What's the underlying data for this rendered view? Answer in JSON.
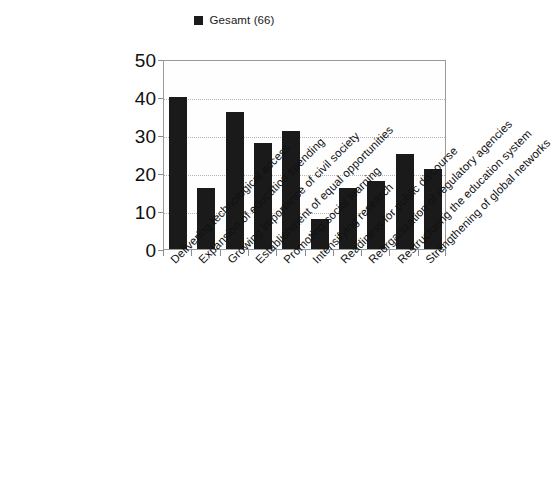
{
  "legend": {
    "swatch_color": "#1a1a1a",
    "label": "Gesamt (66)"
  },
  "axis": {
    "y_ticks": [
      "50",
      "40",
      "30",
      "20",
      "10",
      "0"
    ]
  },
  "chart_data": {
    "type": "bar",
    "title": "",
    "subtitle": "",
    "xlabel": "",
    "ylabel": "",
    "ylim": [
      0,
      50
    ],
    "ytick_step": 10,
    "grid": true,
    "legend_position": "top-center",
    "bar_color": "#1a1a1a",
    "categories": [
      "Delivering technological access",
      "Expansion of education spending",
      "Growing importance of civil society",
      "Establishment of equal opportunities",
      "Promoting social learning",
      "Intensifying research",
      "Readiness for public discourse",
      "Reorganization of regulatory agencies",
      "Restructuring the education system",
      "Strengthening of global networks"
    ],
    "series": [
      {
        "name": "Gesamt (66)",
        "values": [
          40,
          16,
          36,
          28,
          31,
          8,
          16,
          18,
          25,
          21
        ]
      }
    ]
  }
}
